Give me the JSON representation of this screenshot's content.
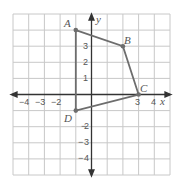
{
  "diagram": {
    "type": "coordinate-plane-quadrilateral",
    "grid": {
      "xmin": -5,
      "xmax": 5,
      "ymin": -5,
      "ymax": 5
    },
    "axes": {
      "x_label": "x",
      "y_label": "y"
    },
    "x_ticks": [
      "−4",
      "−3",
      "−2",
      "3",
      "4"
    ],
    "y_ticks": [
      "3",
      "2",
      "1",
      "2",
      "3",
      "4"
    ],
    "points": [
      {
        "name": "A",
        "x": -1,
        "y": 4
      },
      {
        "name": "B",
        "x": 2,
        "y": 3
      },
      {
        "name": "C",
        "x": 3,
        "y": 0
      },
      {
        "name": "D",
        "x": -1,
        "y": -1
      }
    ],
    "colors": {
      "grid": "#c8c8c8",
      "axis": "#333333",
      "shape": "#6d6d6d"
    }
  }
}
